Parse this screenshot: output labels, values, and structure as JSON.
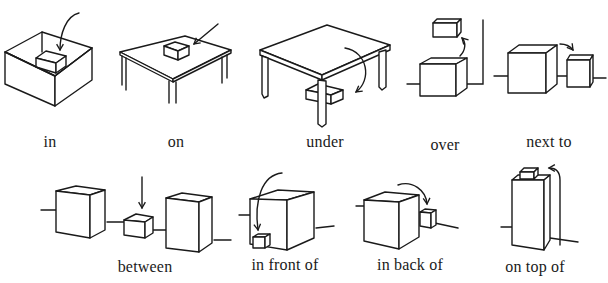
{
  "panels": [
    {
      "id": "in",
      "label": "in"
    },
    {
      "id": "on",
      "label": "on"
    },
    {
      "id": "under",
      "label": "under"
    },
    {
      "id": "over",
      "label": "over"
    },
    {
      "id": "next-to",
      "label": "next to"
    },
    {
      "id": "between",
      "label": "between"
    },
    {
      "id": "in-front-of",
      "label": "in front of"
    },
    {
      "id": "in-back-of",
      "label": "in back of"
    },
    {
      "id": "on-top-of",
      "label": "on top of"
    }
  ],
  "colors": {
    "ink": "#1a1a1a",
    "background": "#ffffff"
  }
}
